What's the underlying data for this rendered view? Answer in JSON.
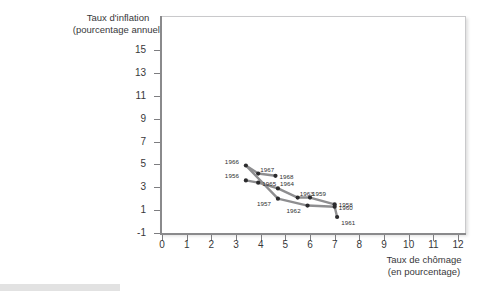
{
  "axes": {
    "y_title_line1": "Taux d'inflation",
    "y_title_line2": "(pourcentage annuel)",
    "x_title_line1": "Taux de chômage",
    "x_title_line2": "(en pourcentage)"
  },
  "chart_data": {
    "type": "line",
    "title": "",
    "xlabel": "Taux de chômage (en pourcentage)",
    "ylabel": "Taux d'inflation (pourcentage annuel)",
    "xlim": [
      0,
      12.5
    ],
    "ylim": [
      -1,
      16
    ],
    "xticks": [
      0,
      1,
      2,
      3,
      4,
      5,
      6,
      7,
      8,
      9,
      10,
      11,
      12
    ],
    "yticks": [
      -1,
      1,
      3,
      5,
      7,
      9,
      11,
      13,
      15
    ],
    "grid": false,
    "legend": null,
    "marker_color": "#2b2b2d",
    "line_color": "#8e8e90",
    "points": [
      {
        "label": "1966",
        "x": 3.4,
        "y": 4.9,
        "label_pos": "left"
      },
      {
        "label": "1967",
        "x": 3.9,
        "y": 4.2,
        "label_pos": "above-right"
      },
      {
        "label": "1968",
        "x": 4.6,
        "y": 4.0,
        "label_pos": "right"
      },
      {
        "label": "1956",
        "x": 3.4,
        "y": 3.6,
        "label_pos": "left"
      },
      {
        "label": "1965",
        "x": 3.9,
        "y": 3.4,
        "label_pos": "right"
      },
      {
        "label": "1964",
        "x": 4.7,
        "y": 2.9,
        "label_pos": "above-right"
      },
      {
        "label": "1957",
        "x": 4.7,
        "y": 2.0,
        "label_pos": "left-below"
      },
      {
        "label": "1963",
        "x": 5.5,
        "y": 2.1,
        "label_pos": "above-right"
      },
      {
        "label": "1962",
        "x": 5.9,
        "y": 1.4,
        "label_pos": "left-below"
      },
      {
        "label": "1959",
        "x": 6.0,
        "y": 2.1,
        "label_pos": "above-right"
      },
      {
        "label": "1958",
        "x": 7.0,
        "y": 1.5,
        "label_pos": "right"
      },
      {
        "label": "1960",
        "x": 7.0,
        "y": 1.3,
        "label_pos": "right"
      },
      {
        "label": "1961",
        "x": 7.1,
        "y": 0.4,
        "label_pos": "right-below"
      }
    ],
    "series": [
      {
        "name": "upper-path",
        "point_labels": [
          "1966",
          "1967",
          "1968"
        ],
        "x": [
          3.4,
          3.9,
          4.6
        ],
        "values": [
          4.9,
          4.2,
          4.0
        ]
      },
      {
        "name": "middle-path",
        "point_labels": [
          "1956",
          "1965",
          "1964",
          "1963",
          "1959",
          "1958"
        ],
        "x": [
          3.4,
          3.9,
          4.7,
          5.5,
          6.0,
          7.0
        ],
        "values": [
          3.6,
          3.4,
          2.9,
          2.1,
          2.1,
          1.5
        ]
      },
      {
        "name": "lower-path",
        "point_labels": [
          "1966",
          "1957",
          "1962",
          "1960",
          "1961"
        ],
        "x": [
          3.4,
          4.7,
          5.9,
          7.0,
          7.1
        ],
        "values": [
          4.9,
          2.0,
          1.4,
          1.3,
          0.4
        ]
      }
    ]
  }
}
